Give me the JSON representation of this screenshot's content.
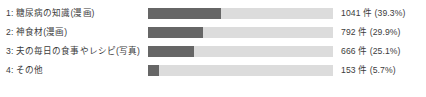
{
  "chart_data": {
    "type": "bar",
    "orientation": "horizontal",
    "title": "",
    "xlabel": "",
    "ylabel": "",
    "grid": false,
    "legend": false,
    "axis_max_percent": 100,
    "track_color": "#dcdcdc",
    "fill_color": "#666666",
    "text_color": "#3c3c3c",
    "categories": [
      "1: 糖尿病の知識(漫画)",
      "2: 神食材(漫画)",
      "3: 夫の毎日の食事やレシピ(写真)",
      "4: その他"
    ],
    "values": [
      1041,
      792,
      666,
      153
    ],
    "percents": [
      39.3,
      29.9,
      25.1,
      5.7
    ],
    "unit": "件",
    "rows": [
      {
        "index": "1",
        "label": "1: 糖尿病の知識(漫画)",
        "count": 1041,
        "percent": 39.3,
        "value_text": "1041 件 (39.3%)",
        "bar_width_pct": 39.3
      },
      {
        "index": "2",
        "label": "2: 神食材(漫画)",
        "count": 792,
        "percent": 29.9,
        "value_text": "792 件 (29.9%)",
        "bar_width_pct": 29.9
      },
      {
        "index": "3",
        "label": "3: 夫の毎日の食事やレシピ(写真)",
        "count": 666,
        "percent": 25.1,
        "value_text": "666 件 (25.1%)",
        "bar_width_pct": 25.1
      },
      {
        "index": "4",
        "label": "4: その他",
        "count": 153,
        "percent": 5.7,
        "value_text": "153 件 (5.7%)",
        "bar_width_pct": 5.7
      }
    ]
  }
}
